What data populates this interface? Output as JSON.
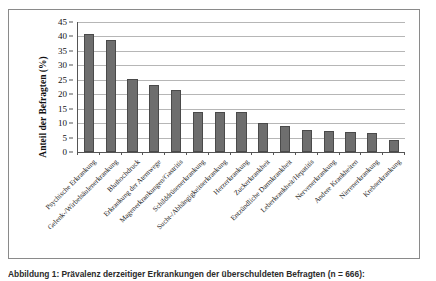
{
  "figure": {
    "caption": "Abbildung 1: Prävalenz derzeitiger Erkrankungen der überschuldeten Befragten (n = 666):"
  },
  "chart_data": {
    "type": "bar",
    "title": "",
    "subtitle": "",
    "xlabel": "",
    "ylabel": "Anteil der Befragten (%)",
    "ylim": [
      0,
      45
    ],
    "yticks": [
      0,
      5,
      10,
      15,
      20,
      25,
      30,
      35,
      40,
      45
    ],
    "grid": true,
    "legend": "none",
    "orientation": "vertical",
    "bar_color": "#6e6e6e",
    "bar_edge_color": "#4a4a4a",
    "gridline_color": "#b6b6b6",
    "axis_color": "#555555",
    "frame_color": "#8a8a8a",
    "categories": [
      "Psychische Erkrankung",
      "Gelenk-/Wirbelsäulenerkrankung",
      "Bluthochdruck",
      "Erkrankung der Atemwege",
      "Magenerkrankungen/Gastritis",
      "Schilddrüsenerkrankung",
      "Sucht-/Abhängigkeitserkrankung",
      "Herzerkrankung",
      "Zuckerkrankheit",
      "Entzündliche Darmkrankheit",
      "Leberkrankheit/Hepatitis",
      "Nervenerkrankung",
      "Andere Krankheiten",
      "Nierenerkrankung",
      "Krebserkrankung"
    ],
    "values": [
      40.7,
      38.9,
      25.2,
      23.3,
      21.3,
      13.8,
      13.9,
      13.7,
      10.0,
      9.1,
      7.6,
      7.3,
      7.1,
      6.7,
      4.3
    ]
  }
}
